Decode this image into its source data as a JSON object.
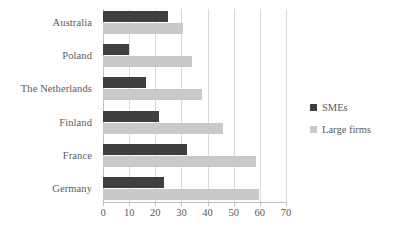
{
  "chart_data": {
    "type": "bar",
    "orientation": "horizontal",
    "title": "",
    "xlabel": "",
    "ylabel": "",
    "xlim": [
      0,
      70
    ],
    "xticks": [
      0,
      10,
      20,
      30,
      40,
      50,
      60,
      70
    ],
    "grid": true,
    "legend_position": "right",
    "categories": [
      "Australia",
      "Poland",
      "The Netherlands",
      "Finland",
      "France",
      "Germany"
    ],
    "series": [
      {
        "name": "SMEs",
        "color": "#3f3f3f",
        "values": [
          25,
          10,
          16.5,
          21.5,
          32,
          23.5
        ]
      },
      {
        "name": "Large firms",
        "color": "#c9c9c9",
        "values": [
          30.5,
          34,
          38,
          46,
          58.5,
          59.5
        ]
      }
    ]
  },
  "artifacts": {
    "left_mark": "·",
    "top_right_mark": "·"
  }
}
